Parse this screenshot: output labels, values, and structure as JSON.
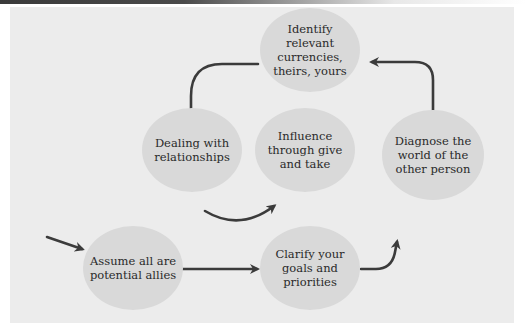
{
  "diagram": {
    "type": "cycle-flow",
    "colors": {
      "node_fill": "#d9d9d9",
      "panel_bg": "#ececec",
      "arrow": "#3b3b3b",
      "text": "#2a2a2a"
    },
    "nodes": [
      {
        "id": "identify",
        "label": "Identify\nrelevant\ncurrencies,\ntheirs, yours"
      },
      {
        "id": "dealing",
        "label": "Dealing with\nrelationships"
      },
      {
        "id": "influence",
        "label": "Influence\nthrough give\nand take"
      },
      {
        "id": "diagnose",
        "label": "Diagnose the\nworld of the\nother person"
      },
      {
        "id": "assume",
        "label": "Assume all are\npotential allies"
      },
      {
        "id": "clarify",
        "label": "Clarify your\ngoals and\npriorities"
      }
    ],
    "edges": [
      {
        "from": "start",
        "to": "assume"
      },
      {
        "from": "assume",
        "to": "clarify"
      },
      {
        "from": "clarify",
        "to": "diagnose"
      },
      {
        "from": "diagnose",
        "to": "identify"
      },
      {
        "from": "identify",
        "to": "dealing"
      },
      {
        "from": "dealing",
        "to": "influence"
      }
    ]
  }
}
